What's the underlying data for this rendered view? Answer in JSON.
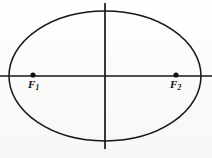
{
  "figure": {
    "name": "ellipse-with-foci",
    "caption": "",
    "background_color": "#fbfbfa",
    "ink_color": "#171717"
  },
  "labels": {
    "focus1": {
      "base": "F",
      "subscript": "1",
      "full": "F1"
    },
    "focus2": {
      "base": "F",
      "subscript": "2",
      "full": "F2"
    }
  },
  "chart_data": {
    "type": "diagram",
    "title": "",
    "xlabel": "",
    "ylabel": "",
    "shapes": [
      {
        "kind": "ellipse",
        "name": "ellipse-curve",
        "center_x": 105,
        "center_y": 76,
        "radius_x": 96,
        "radius_y": 65,
        "stroke": "#171717",
        "stroke_width": 1.5,
        "fill": "none"
      },
      {
        "kind": "line",
        "name": "major-axis",
        "x1": 0,
        "y1": 76,
        "x2": 212,
        "y2": 76,
        "stroke": "#171717",
        "stroke_width": 1.6
      },
      {
        "kind": "line",
        "name": "minor-axis",
        "x1": 105,
        "y1": 3,
        "x2": 105,
        "y2": 149,
        "stroke": "#171717",
        "stroke_width": 1.6
      }
    ],
    "points": [
      {
        "name": "focus-1",
        "label": "F1",
        "x": 33,
        "y": 75,
        "radius": 2.6,
        "fill": "#111111"
      },
      {
        "name": "focus-2",
        "label": "F2",
        "x": 176,
        "y": 75,
        "radius": 2.6,
        "fill": "#111111"
      }
    ],
    "axis_ranges": {
      "x": [
        0,
        212
      ],
      "y": [
        0,
        158
      ]
    },
    "grid": false,
    "legend": false
  }
}
